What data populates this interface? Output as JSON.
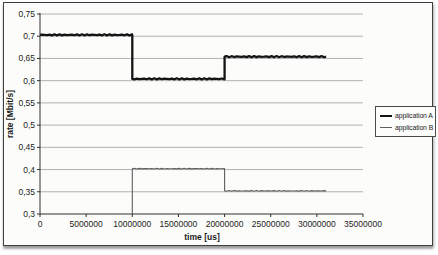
{
  "figure": {
    "background": "#fcfcfa",
    "frame_border_color": "#3f3f3f"
  },
  "chart_data": {
    "type": "line",
    "title": "",
    "xlabel": "time [us]",
    "ylabel": "rate [Mbit/s]",
    "xlim": [
      0,
      35000000
    ],
    "ylim": [
      0.3,
      0.75
    ],
    "x_ticks": [
      0,
      5000000,
      10000000,
      15000000,
      20000000,
      25000000,
      30000000,
      35000000
    ],
    "x_tick_labels": [
      "0",
      "5000000",
      "10000000",
      "15000000",
      "20000000",
      "25000000",
      "30000000",
      "35000000"
    ],
    "y_ticks": [
      0.3,
      0.35,
      0.4,
      0.45,
      0.5,
      0.55,
      0.6,
      0.65,
      0.7,
      0.75
    ],
    "y_tick_labels": [
      "0,3",
      "0,35",
      "0,4",
      "0,45",
      "0,5",
      "0,55",
      "0,6",
      "0,65",
      "0,7",
      "0,75"
    ],
    "grid": true,
    "grid_color": "#a9a9a9",
    "axis_color": "#2e2e2e",
    "text_color": "#1c1c1c",
    "legend_position": "right",
    "series": [
      {
        "name": "application A",
        "color": "#141414",
        "stroke_width": 2.3,
        "noise": 0.6,
        "points": [
          [
            0,
            0.703
          ],
          [
            10000000,
            0.703
          ],
          [
            10000000,
            0.604
          ],
          [
            20000000,
            0.604
          ],
          [
            20000000,
            0.654
          ],
          [
            31000000,
            0.654
          ]
        ]
      },
      {
        "name": "application B",
        "color": "#5f5f5f",
        "stroke_width": 1.1,
        "noise": 0.35,
        "points": [
          [
            10000000,
            0.3
          ],
          [
            10000000,
            0.402
          ],
          [
            20000000,
            0.402
          ],
          [
            20000000,
            0.352
          ],
          [
            31000000,
            0.352
          ]
        ]
      }
    ]
  }
}
